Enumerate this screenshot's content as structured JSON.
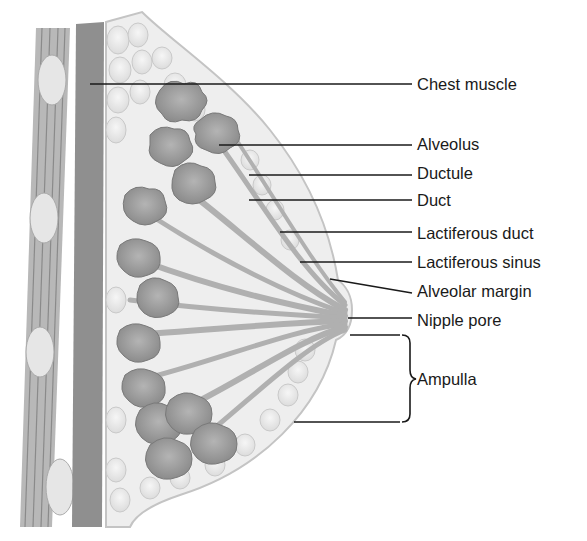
{
  "diagram": {
    "labels": [
      {
        "id": "chest-muscle",
        "text": "Chest muscle",
        "x": 417,
        "y": 76,
        "line_from": [
          90,
          84
        ],
        "line_to": [
          412,
          84
        ]
      },
      {
        "id": "alveolus",
        "text": "Alveolus",
        "x": 417,
        "y": 136,
        "line_from": [
          219,
          145
        ],
        "line_to": [
          412,
          145
        ]
      },
      {
        "id": "ductule",
        "text": "Ductule",
        "x": 417,
        "y": 164,
        "line_from": [
          249,
          175
        ],
        "line_to": [
          412,
          175
        ]
      },
      {
        "id": "duct",
        "text": "Duct",
        "x": 417,
        "y": 192,
        "line_from": [
          249,
          200
        ],
        "line_to": [
          412,
          200
        ]
      },
      {
        "id": "lactiferous-duct",
        "text": "Lactiferous duct",
        "x": 417,
        "y": 226,
        "line_from": [
          280,
          232
        ],
        "line_to": [
          412,
          232
        ]
      },
      {
        "id": "lactiferous-sinus",
        "text": "Lactiferous sinus",
        "x": 417,
        "y": 255,
        "line_from": [
          300,
          262
        ],
        "line_to": [
          412,
          262
        ]
      },
      {
        "id": "alveolar-margin",
        "text": "Alveolar margin",
        "x": 417,
        "y": 284,
        "line_from": [
          330,
          279
        ],
        "line_to": [
          412,
          293
        ]
      },
      {
        "id": "nipple-pore",
        "text": "Nipple pore",
        "x": 417,
        "y": 313,
        "line_from": [
          348,
          318
        ],
        "line_to": [
          412,
          318
        ]
      },
      {
        "id": "ampulla",
        "text": "Ampulla",
        "x": 417,
        "y": 372,
        "line_from": [
          350,
          335
        ],
        "line_to": [
          400,
          335
        ]
      }
    ],
    "ampulla_bracket": {
      "top": 335,
      "bottom": 422,
      "x": 404,
      "lower_line_from": [
        294,
        422
      ],
      "lower_line_to": [
        400,
        422
      ]
    },
    "colors": {
      "muscle_band": "#8f8f8f",
      "rib_stripes": "#a8a8a8",
      "fat_lobules": "#e8e8e8",
      "gland_lobes": "#9a9a9a",
      "ducts": "#b5b5b5",
      "outline": "#bdbdbd",
      "leader_lines": "#1a1a1a"
    }
  }
}
